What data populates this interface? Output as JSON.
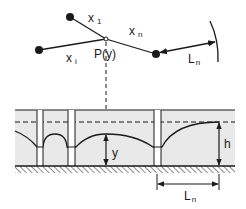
{
  "diagram": {
    "type": "well-field-drawdown",
    "colors": {
      "line": "#1a1a1a",
      "aquifer_fill": "#e9e9e9",
      "well_fill": "#ffffff",
      "background": "#ffffff"
    },
    "plan_view": {
      "point_label": "P(y)",
      "segments": [
        {
          "label_main": "x",
          "label_sub": "1"
        },
        {
          "label_main": "x",
          "label_sub": "i"
        },
        {
          "label_main": "x",
          "label_sub": "n"
        }
      ],
      "radius_label_main": "L",
      "radius_label_sub": "n"
    },
    "section_view": {
      "y_label": "y",
      "h_label": "h",
      "distance_label_main": "L",
      "distance_label_sub": "n",
      "well_count": 3
    }
  }
}
